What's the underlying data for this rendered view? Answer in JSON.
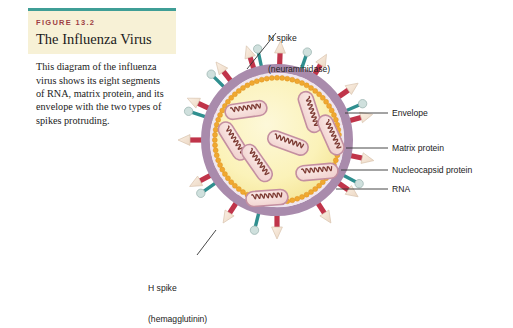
{
  "figure": {
    "number_label": "FIGURE 13.2",
    "title": "The Influenza Virus",
    "caption": "This diagram of the influenza virus shows its eight segments of RNA, matrix protein, and its envelope with the two types of spikes protruding.",
    "rule_color": "#3f9e96",
    "head_bg": "#f7f1d6",
    "fig_num_color": "#9d3f44"
  },
  "labels": {
    "n_spike_line1": "N spike",
    "n_spike_line2": "(neuraminidase)",
    "h_spike_line1": "H spike",
    "h_spike_line2": "(hemagglutinin)",
    "envelope": "Envelope",
    "matrix_protein": "Matrix protein",
    "nucleocapsid_protein": "Nucleocapsid protein",
    "rna": "RNA"
  },
  "diagram": {
    "name": "influenza-virus-particle",
    "center_x": 277,
    "center_y": 140,
    "outer_radius": 73,
    "colors": {
      "envelope_outer": "#a98bac",
      "envelope_inner_line": "#f4eef3",
      "matrix_bead": "#f0a830",
      "interior": "#faf2bd",
      "interior_edge": "#f6e79a",
      "rna_capsule_fill": "#f6dcd8",
      "rna_capsule_border": "#c48fa0",
      "rna_helix": "#7d3b33",
      "h_spike_shaft": "#c0344a",
      "h_spike_head": "#f6e3d2",
      "n_spike_shaft": "#2f8f8f",
      "n_spike_knob": "#cfe0dd",
      "leader": "#333333"
    },
    "rna_segment_count": 8,
    "rna_segments": [
      {
        "cx": 246,
        "cy": 110,
        "angle": -8
      },
      {
        "cx": 310,
        "cy": 112,
        "angle": 72
      },
      {
        "cx": 331,
        "cy": 135,
        "angle": 66
      },
      {
        "cx": 288,
        "cy": 143,
        "angle": 20
      },
      {
        "cx": 233,
        "cy": 141,
        "angle": 58
      },
      {
        "cx": 257,
        "cy": 163,
        "angle": 55
      },
      {
        "cx": 317,
        "cy": 172,
        "angle": -5
      },
      {
        "cx": 267,
        "cy": 198,
        "angle": -4
      }
    ],
    "h_spikes_deg": [
      272,
      300,
      325,
      345,
      12,
      35,
      57,
      90,
      123,
      152,
      180,
      205,
      232,
      252
    ],
    "n_spikes_deg": [
      258,
      289,
      337,
      28,
      104,
      145,
      198,
      225
    ]
  }
}
